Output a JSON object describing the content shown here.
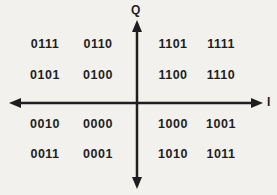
{
  "diagram": {
    "axes": {
      "vertical_label": "Q",
      "horizontal_label": "I"
    },
    "colors": {
      "background": "#f2f1ee",
      "ink": "#1e1e1e"
    },
    "codes": {
      "rows": [
        [
          "0111",
          "0110",
          "1101",
          "1111"
        ],
        [
          "0101",
          "0100",
          "1100",
          "1110"
        ],
        [
          "0010",
          "0000",
          "1000",
          "1001"
        ],
        [
          "0011",
          "0001",
          "1010",
          "1011"
        ]
      ]
    }
  }
}
